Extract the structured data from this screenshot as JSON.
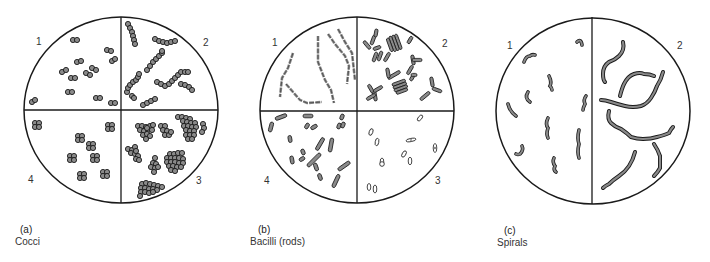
{
  "figure": {
    "panels": [
      {
        "id": "a",
        "tag": "(a)",
        "name": "Cocci",
        "quadrants": [
          "1",
          "2",
          "3",
          "4"
        ],
        "arrangements": [
          "diplococci",
          "streptococci",
          "staphylococci",
          "tetrads"
        ]
      },
      {
        "id": "b",
        "tag": "(b)",
        "name": "Bacilli (rods)",
        "quadrants": [
          "1",
          "2",
          "3",
          "4"
        ],
        "arrangements": [
          "streptobacilli chains",
          "branching / palisade rods",
          "spore-forming rods",
          "single rods"
        ]
      },
      {
        "id": "c",
        "tag": "(c)",
        "name": "Spirals",
        "quadrants": [
          "1",
          "2"
        ],
        "arrangements": [
          "short curved / vibrio forms",
          "long spirochetes"
        ]
      }
    ],
    "colors": {
      "outline": "#1a1a1a",
      "cell_fill": "#8a8a8a",
      "background": "#ffffff"
    }
  }
}
